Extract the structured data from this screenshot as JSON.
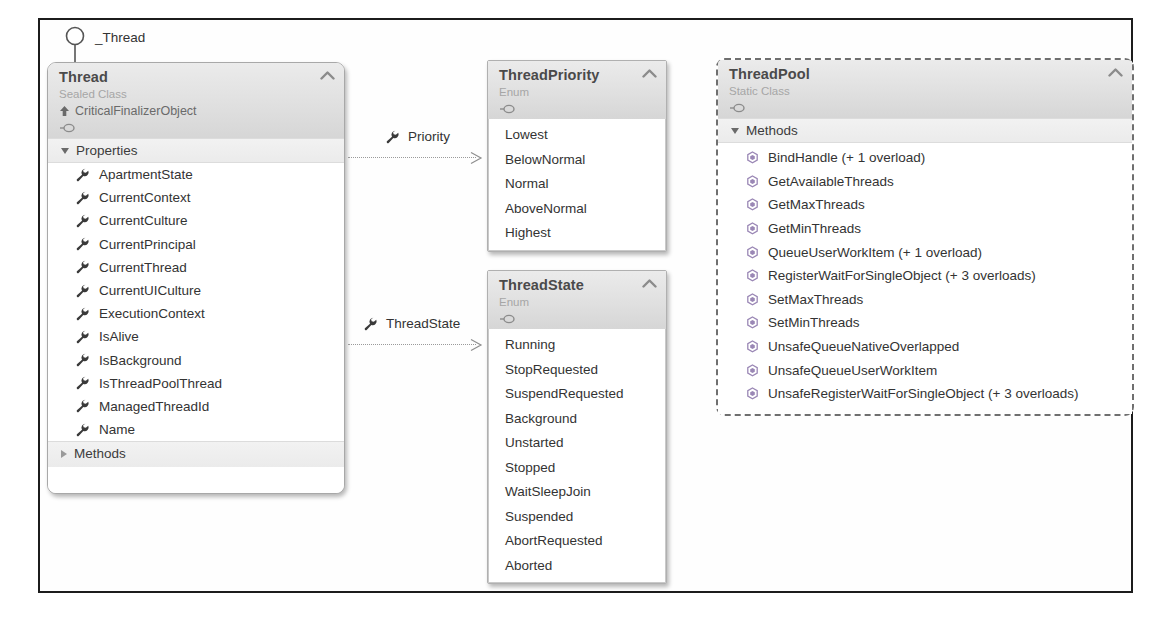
{
  "diagram": {
    "interface_lollipop": {
      "label": "_Thread",
      "icon": "interface-lollipop-icon"
    },
    "shapes": [
      {
        "id": "thread",
        "title": "Thread",
        "stereotype": "Sealed Class",
        "base_class": "CriticalFinalizerObject",
        "base_class_icon": "inheritance-arrow-icon",
        "interface_icon": "interface-lollipop-icon",
        "collapse_icon": "chevron-up-icon",
        "border": "solid-rounded",
        "compartments": [
          {
            "name": "Properties",
            "expanded": true,
            "expander_icon": "triangle-down-icon",
            "members": [
              {
                "label": "ApartmentState",
                "icon": "property-wrench-icon"
              },
              {
                "label": "CurrentContext",
                "icon": "property-wrench-icon"
              },
              {
                "label": "CurrentCulture",
                "icon": "property-wrench-icon"
              },
              {
                "label": "CurrentPrincipal",
                "icon": "property-wrench-icon"
              },
              {
                "label": "CurrentThread",
                "icon": "property-wrench-icon"
              },
              {
                "label": "CurrentUICulture",
                "icon": "property-wrench-icon"
              },
              {
                "label": "ExecutionContext",
                "icon": "property-wrench-icon"
              },
              {
                "label": "IsAlive",
                "icon": "property-wrench-icon"
              },
              {
                "label": "IsBackground",
                "icon": "property-wrench-icon"
              },
              {
                "label": "IsThreadPoolThread",
                "icon": "property-wrench-icon"
              },
              {
                "label": "ManagedThreadId",
                "icon": "property-wrench-icon"
              },
              {
                "label": "Name",
                "icon": "property-wrench-icon"
              }
            ]
          },
          {
            "name": "Methods",
            "expanded": false,
            "expander_icon": "triangle-right-icon",
            "members": []
          }
        ]
      },
      {
        "id": "threadpriority",
        "title": "ThreadPriority",
        "stereotype": "Enum",
        "interface_icon": "interface-lollipop-icon",
        "collapse_icon": "chevron-up-icon",
        "border": "rect",
        "enum_members": [
          "Lowest",
          "BelowNormal",
          "Normal",
          "AboveNormal",
          "Highest"
        ]
      },
      {
        "id": "threadstate",
        "title": "ThreadState",
        "stereotype": "Enum",
        "interface_icon": "interface-lollipop-icon",
        "collapse_icon": "chevron-up-icon",
        "border": "rect",
        "enum_members": [
          "Running",
          "StopRequested",
          "SuspendRequested",
          "Background",
          "Unstarted",
          "Stopped",
          "WaitSleepJoin",
          "Suspended",
          "AbortRequested",
          "Aborted"
        ]
      },
      {
        "id": "threadpool",
        "title": "ThreadPool",
        "stereotype": "Static Class",
        "interface_icon": "interface-lollipop-icon",
        "collapse_icon": "chevron-up-icon",
        "border": "dashed-rounded",
        "compartments": [
          {
            "name": "Methods",
            "expanded": true,
            "expander_icon": "triangle-down-icon",
            "members": [
              {
                "label": "BindHandle (+ 1 overload)",
                "icon": "method-cube-icon"
              },
              {
                "label": "GetAvailableThreads",
                "icon": "method-cube-icon"
              },
              {
                "label": "GetMaxThreads",
                "icon": "method-cube-icon"
              },
              {
                "label": "GetMinThreads",
                "icon": "method-cube-icon"
              },
              {
                "label": "QueueUserWorkItem (+ 1 overload)",
                "icon": "method-cube-icon"
              },
              {
                "label": "RegisterWaitForSingleObject (+ 3 overloads)",
                "icon": "method-cube-icon"
              },
              {
                "label": "SetMaxThreads",
                "icon": "method-cube-icon"
              },
              {
                "label": "SetMinThreads",
                "icon": "method-cube-icon"
              },
              {
                "label": "UnsafeQueueNativeOverlapped",
                "icon": "method-cube-icon"
              },
              {
                "label": "UnsafeQueueUserWorkItem",
                "icon": "method-cube-icon"
              },
              {
                "label": "UnsafeRegisterWaitForSingleObject (+ 3 overloads)",
                "icon": "method-cube-icon"
              }
            ]
          }
        ]
      }
    ],
    "associations": [
      {
        "id": "priority",
        "label": "Priority",
        "icon": "property-wrench-icon",
        "from": "thread",
        "to": "threadpriority",
        "line_style": "dotted",
        "arrow": "open-arrow-icon"
      },
      {
        "id": "threadstate",
        "label": "ThreadState",
        "icon": "property-wrench-icon",
        "from": "thread",
        "to": "threadstate",
        "line_style": "dotted",
        "arrow": "open-arrow-icon"
      }
    ]
  },
  "colors": {
    "frame": "#1c1c1c",
    "header_gray": "#e2e2e2",
    "title_text": "#4a4a4a",
    "stereotype_text": "#a6a6a6",
    "body_text": "#333333",
    "connector": "#9a9a9a",
    "method_icon": "#9a87b5",
    "property_icon": "#3a3a3a"
  }
}
